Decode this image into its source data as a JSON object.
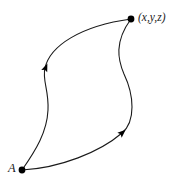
{
  "figure": {
    "background_color": "#ffffff",
    "stroke_color": "#1a1a1a",
    "marker_color": "#000000",
    "width": 184,
    "height": 182,
    "nodes": [
      {
        "id": "origin",
        "label": "A",
        "x": 22,
        "y": 170,
        "dot_radius": 3.4,
        "label_x": 8,
        "label_y": 162
      },
      {
        "id": "endpoint",
        "label": "(x,y,z)",
        "x": 131,
        "y": 19,
        "dot_radius": 3.4,
        "label_x": 138,
        "label_y": 12
      }
    ],
    "paths": [
      {
        "id": "left-path",
        "name": "upper-left-curve",
        "from": "origin",
        "to": "endpoint",
        "direction": "A to (x,y,z)",
        "d": "M 22 170 C 36 150 47 132 48 110 C 49 90 42 80 45 68 C 50 46 80 26 131 19",
        "stroke_width": 1.1,
        "arrow": {
          "id": "left-arrow",
          "x": 45.5,
          "y": 68,
          "angle_deg": -68,
          "size": 8
        }
      },
      {
        "id": "right-path",
        "name": "lower-right-curve",
        "from": "origin",
        "to": "endpoint",
        "direction": "A to (x,y,z)",
        "d": "M 22 170 C 60 168 100 152 122 133 C 136 121 134 95 124 74 C 118 60 114 42 131 19",
        "stroke_width": 1.1,
        "arrow": {
          "id": "right-arrow",
          "x": 122,
          "y": 133,
          "angle_deg": -42,
          "size": 8
        }
      }
    ]
  }
}
